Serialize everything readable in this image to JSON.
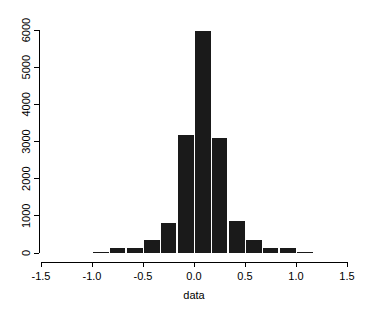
{
  "chart_data": {
    "type": "bar",
    "subtype": "histogram",
    "title": "",
    "xlabel": "data",
    "ylabel": "",
    "xlim": [
      -1.5,
      1.5
    ],
    "ylim": [
      0,
      6000
    ],
    "grid": false,
    "legend": null,
    "bar_color": "#1a1a1a",
    "axis_color": "#000000",
    "background_color": "#ffffff",
    "bin_width": 0.1667,
    "xticks": [
      -1.5,
      -1.0,
      -0.5,
      0.0,
      0.5,
      1.0,
      1.5
    ],
    "xtick_labels": [
      "-1.5",
      "-1.0",
      "-0.5",
      "0.0",
      "0.5",
      "1.0",
      "1.5"
    ],
    "yticks": [
      0,
      1000,
      2000,
      3000,
      4000,
      5000,
      6000
    ],
    "ytick_labels": [
      "0",
      "1000",
      "2000",
      "3000",
      "4000",
      "5000",
      "6000"
    ],
    "bins": [
      {
        "x0": -1.1667,
        "x1": -1.0,
        "value": 0
      },
      {
        "x0": -1.0,
        "x1": -0.8333,
        "value": 40
      },
      {
        "x0": -0.8333,
        "x1": -0.6667,
        "value": 150
      },
      {
        "x0": -0.6667,
        "x1": -0.5,
        "value": 150
      },
      {
        "x0": -0.5,
        "x1": -0.3333,
        "value": 350
      },
      {
        "x0": -0.3333,
        "x1": -0.1667,
        "value": 820
      },
      {
        "x0": -0.1667,
        "x1": 0.0,
        "value": 3180
      },
      {
        "x0": 0.0,
        "x1": 0.1667,
        "value": 6000
      },
      {
        "x0": 0.1667,
        "x1": 0.3333,
        "value": 3120
      },
      {
        "x0": 0.3333,
        "x1": 0.5,
        "value": 870
      },
      {
        "x0": 0.5,
        "x1": 0.6667,
        "value": 350
      },
      {
        "x0": 0.6667,
        "x1": 0.8333,
        "value": 160
      },
      {
        "x0": 0.8333,
        "x1": 1.0,
        "value": 160
      },
      {
        "x0": 1.0,
        "x1": 1.1667,
        "value": 30
      }
    ],
    "categories": [
      "-1.08",
      "-0.92",
      "-0.75",
      "-0.58",
      "-0.42",
      "-0.25",
      "-0.08",
      "0.08",
      "0.25",
      "0.42",
      "0.58",
      "0.75",
      "0.92",
      "1.08"
    ],
    "values": [
      0,
      40,
      150,
      150,
      350,
      820,
      3180,
      6000,
      3120,
      870,
      350,
      160,
      160,
      30
    ]
  },
  "axes": {
    "x_title": "data",
    "y_title": ""
  }
}
